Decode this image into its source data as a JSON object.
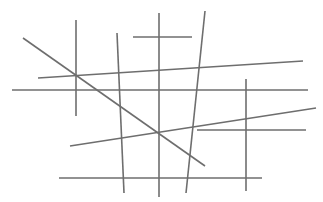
{
  "diagram": {
    "width": 323,
    "height": 202,
    "background": "#ffffff",
    "stroke_color": "#6e6e6e",
    "stroke_width": 1.6,
    "lines": [
      {
        "id": "vertical-left",
        "x1": 76,
        "y1": 20,
        "x2": 76,
        "y2": 116
      },
      {
        "id": "diagonal-main",
        "x1": 23,
        "y1": 38,
        "x2": 205,
        "y2": 166
      },
      {
        "id": "near-vertical-left-center",
        "x1": 117,
        "y1": 33,
        "x2": 124,
        "y2": 193
      },
      {
        "id": "horizontal-top-short",
        "x1": 133,
        "y1": 37,
        "x2": 192,
        "y2": 37
      },
      {
        "id": "vertical-center",
        "x1": 159,
        "y1": 13,
        "x2": 159,
        "y2": 197
      },
      {
        "id": "slanted-right-center",
        "x1": 205,
        "y1": 11,
        "x2": 186,
        "y2": 193
      },
      {
        "id": "slanted-upper-long",
        "x1": 38,
        "y1": 78,
        "x2": 303,
        "y2": 61
      },
      {
        "id": "horizontal-middle-long",
        "x1": 12,
        "y1": 90,
        "x2": 308,
        "y2": 90
      },
      {
        "id": "vertical-right",
        "x1": 246,
        "y1": 79,
        "x2": 246,
        "y2": 191
      },
      {
        "id": "slanted-lower-long",
        "x1": 70,
        "y1": 146,
        "x2": 316,
        "y2": 108
      },
      {
        "id": "horizontal-right-short",
        "x1": 197,
        "y1": 130,
        "x2": 306,
        "y2": 130
      },
      {
        "id": "horizontal-bottom",
        "x1": 59,
        "y1": 178,
        "x2": 262,
        "y2": 178
      }
    ]
  }
}
